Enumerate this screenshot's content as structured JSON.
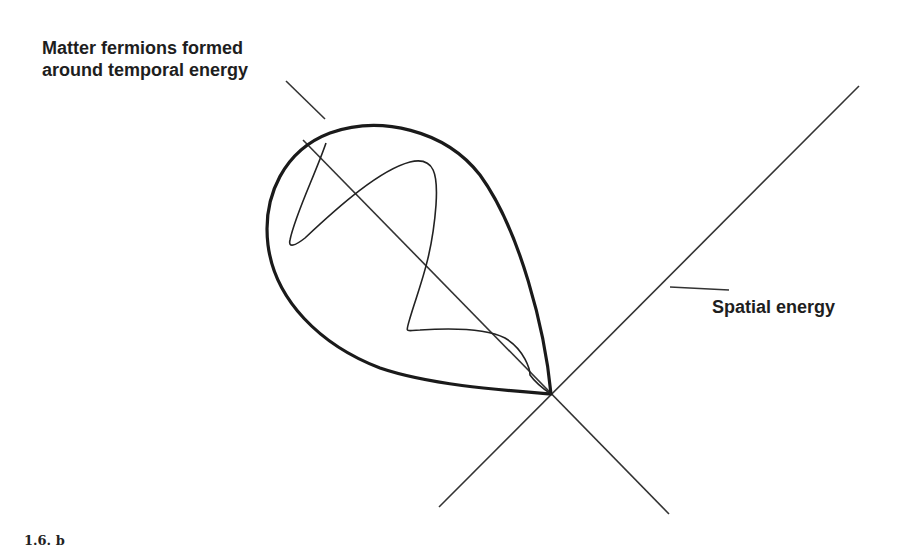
{
  "figure": {
    "caption": "1.6. b",
    "labels": {
      "matter_line1": "Matter fermions formed",
      "matter_line2": "around temporal energy",
      "spatial": "Spatial energy"
    },
    "colors": {
      "stroke": "#1e1e1e",
      "background": "#ffffff"
    },
    "elements": {
      "spatial_axis": {
        "from": [
          439,
          507
        ],
        "to": [
          859,
          86
        ]
      },
      "temporal_axis": {
        "from": [
          303,
          140
        ],
        "to": [
          669,
          514
        ]
      },
      "intersection": [
        551,
        394
      ],
      "matter_pointer": {
        "from": [
          286,
          81
        ],
        "to": [
          325,
          119
        ]
      },
      "spatial_pointer": {
        "from": [
          670,
          287
        ],
        "to": [
          729,
          289
        ]
      },
      "teardrop_tip": [
        551,
        394
      ],
      "wave": "sinuous line oscillating along temporal axis inside teardrop"
    }
  }
}
